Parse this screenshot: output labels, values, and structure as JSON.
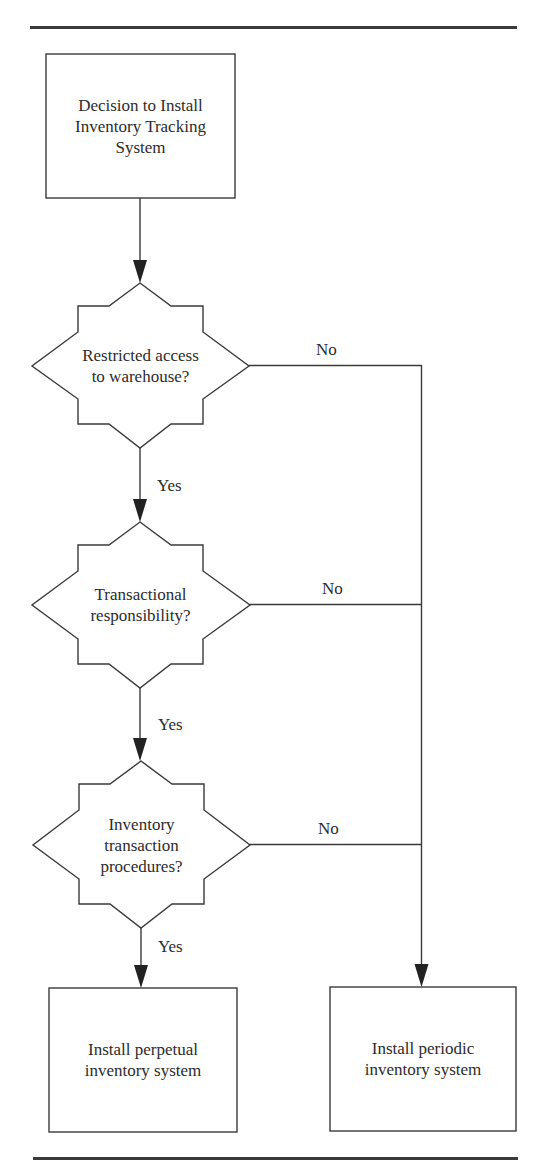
{
  "diagram": {
    "type": "flowchart",
    "start": {
      "id": "start",
      "label": "Decision to Install\nInventory Tracking\nSystem"
    },
    "decisions": [
      {
        "id": "d1",
        "label": "Restricted access\nto warehouse?",
        "yes_label": "Yes",
        "no_label": "No"
      },
      {
        "id": "d2",
        "label": "Transactional\nresponsibility?",
        "yes_label": "Yes",
        "no_label": "No"
      },
      {
        "id": "d3",
        "label": "Inventory\ntransaction\nprocedures?",
        "yes_label": "Yes",
        "no_label": "No"
      }
    ],
    "outcomes": [
      {
        "id": "perpetual",
        "label": "Install perpetual\ninventory system"
      },
      {
        "id": "periodic",
        "label": "Install periodic\ninventory system"
      }
    ],
    "edges": [
      {
        "from": "start",
        "to": "d1",
        "label": ""
      },
      {
        "from": "d1",
        "to": "d2",
        "label": "Yes"
      },
      {
        "from": "d1",
        "to": "periodic",
        "label": "No"
      },
      {
        "from": "d2",
        "to": "d3",
        "label": "Yes"
      },
      {
        "from": "d2",
        "to": "periodic",
        "label": "No"
      },
      {
        "from": "d3",
        "to": "perpetual",
        "label": "Yes"
      },
      {
        "from": "d3",
        "to": "periodic",
        "label": "No"
      }
    ]
  }
}
